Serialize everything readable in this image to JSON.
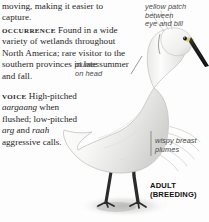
{
  "page": {
    "background": "#fdfdfd",
    "text_color": "#262626"
  },
  "body_text": {
    "line_continuation": "moving, making it easier to capture.",
    "occurrence_label": "Occurrence",
    "occurrence_text": "Found in a wide variety of wetlands throughout North America; rare visitor to the southern provinces in late summer and fall.",
    "voice_label": "Voice",
    "voice_text_1": "High-pitched",
    "voice_onom_1": "aargaang",
    "voice_text_2": "when flushed; low-pitched",
    "voice_onom_2": "arg",
    "voice_conj": "and",
    "voice_onom_3": "raah",
    "voice_text_3": "aggressive calls."
  },
  "annotations": [
    {
      "id": "yellow-patch",
      "lines": [
        "yellow patch",
        "between",
        "eye and bill"
      ]
    },
    {
      "id": "head-plumes",
      "lines": [
        "plumes",
        "on head"
      ]
    },
    {
      "id": "breast-plumes",
      "lines": [
        "wispy breast",
        "plumes"
      ]
    }
  ],
  "caption": {
    "line1": "ADULT",
    "line2": "(BREEDING)"
  },
  "illustration": {
    "subject": "great-egret-bird",
    "plumage_color": "#f4f4f2",
    "shadow_color": "#c9c9c7",
    "bill_color": "#1f1f1f",
    "leg_color": "#2b2b2b",
    "yellow_patch_color": "#d8c35f"
  }
}
